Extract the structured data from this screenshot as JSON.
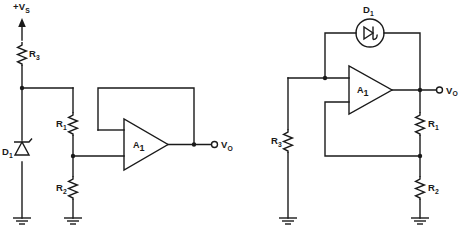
{
  "figure": {
    "type": "electronic-schematic",
    "background_color": "#ffffff",
    "line_color": "#1a1a1a",
    "width": 465,
    "height": 243
  },
  "circuits": [
    {
      "id": "left",
      "name": "zener-reference-noninverting-amplifier",
      "supply": {
        "label_prefix": "+V",
        "label_sub": "S",
        "full_label": "+Vs",
        "symbol": "up-arrow-supply-rail"
      },
      "output": {
        "label_prefix": "V",
        "label_sub": "O",
        "full_label": "Vo",
        "symbol": "open-circle-terminal"
      },
      "opamp": {
        "label_prefix": "A",
        "label_sub": "1",
        "full_label": "A1",
        "shape": "triangle-pointing-right",
        "inverting_input": "top",
        "noninverting_input": "bottom"
      },
      "components": [
        {
          "ref_prefix": "R",
          "ref_sub": "3",
          "full_ref": "R3",
          "type": "resistor",
          "orientation": "vertical"
        },
        {
          "ref_prefix": "D",
          "ref_sub": "1",
          "full_ref": "D1",
          "type": "zener-diode",
          "orientation": "vertical"
        },
        {
          "ref_prefix": "R",
          "ref_sub": "1",
          "full_ref": "R1",
          "type": "resistor",
          "orientation": "vertical"
        },
        {
          "ref_prefix": "R",
          "ref_sub": "2",
          "full_ref": "R2",
          "type": "resistor",
          "orientation": "vertical"
        }
      ],
      "grounds": 2,
      "nodes": 3
    },
    {
      "id": "right",
      "name": "led-driver-noninverting-amplifier",
      "output": {
        "label_prefix": "V",
        "label_sub": "O",
        "full_label": "Vo",
        "symbol": "open-circle-terminal"
      },
      "opamp": {
        "label_prefix": "A",
        "label_sub": "1",
        "full_label": "A1",
        "shape": "triangle-pointing-right",
        "inverting_input": "top",
        "noninverting_input": "bottom"
      },
      "components": [
        {
          "ref_prefix": "D",
          "ref_sub": "1",
          "full_ref": "D1",
          "type": "circled-diode-led",
          "orientation": "horizontal"
        },
        {
          "ref_prefix": "R",
          "ref_sub": "3",
          "full_ref": "R3",
          "type": "resistor",
          "orientation": "vertical"
        },
        {
          "ref_prefix": "R",
          "ref_sub": "1",
          "full_ref": "R1",
          "type": "resistor",
          "orientation": "vertical"
        },
        {
          "ref_prefix": "R",
          "ref_sub": "2",
          "full_ref": "R2",
          "type": "resistor",
          "orientation": "vertical"
        }
      ],
      "grounds": 2,
      "nodes": 3
    }
  ],
  "captions": {
    "left": "",
    "right": ""
  }
}
